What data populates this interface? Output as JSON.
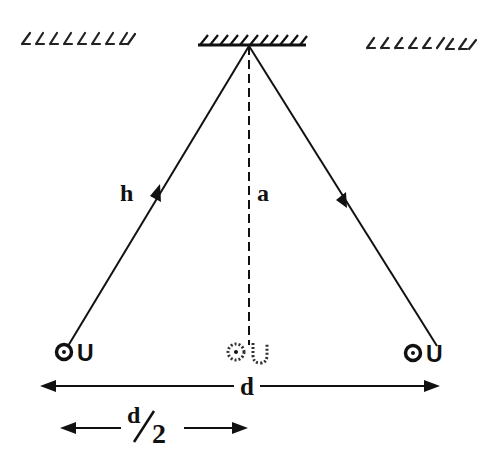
{
  "figure": {
    "type": "geometry-diagram",
    "colors": {
      "ink": "#111111",
      "background": "#ffffff"
    }
  },
  "labels": {
    "incident_path": "h",
    "vertical_height": "a",
    "separation": "d",
    "half_separation_num": "d",
    "half_separation_den": "2"
  },
  "sources": {
    "left": "U",
    "center": "U",
    "right": "U"
  },
  "ceilings": [
    {
      "name": "left-hatch",
      "style": "faded"
    },
    {
      "name": "center-ceiling",
      "style": "solid"
    },
    {
      "name": "right-hatch",
      "style": "faded"
    }
  ]
}
